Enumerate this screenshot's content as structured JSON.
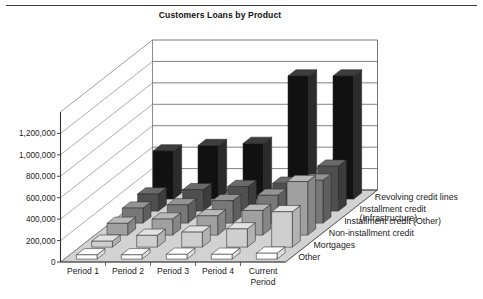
{
  "page": {
    "top_rule": true,
    "background": "#ffffff"
  },
  "chart_data": {
    "type": "bar",
    "variant": "3d-grouped-column",
    "title": "Customers Loans by Product",
    "xlabel": "",
    "ylabel": "",
    "categories": [
      "Period 1",
      "Period 2",
      "Period 3",
      "Period 4",
      "Current Period"
    ],
    "category_label_lines": [
      [
        "Period 1"
      ],
      [
        "Period 2"
      ],
      [
        "Period 3"
      ],
      [
        "Period 4"
      ],
      [
        "Current",
        "Period"
      ]
    ],
    "ylim": [
      0,
      1400000
    ],
    "yticks": [
      0,
      200000,
      400000,
      600000,
      800000,
      1000000,
      1200000
    ],
    "ytick_labels": [
      "0",
      "200,000",
      "400,000",
      "600,000",
      "800,000",
      "1,000,000",
      "1,200,000"
    ],
    "grid": true,
    "grid_axis": "y",
    "legend_position": "right-depth-axis",
    "series": [
      {
        "name": "Revolving credit lines",
        "label_lines": [
          "Revolving credit lines"
        ],
        "color": "#111111",
        "side_color": "#2b2b2b",
        "top_color": "#3d3d3d",
        "values": [
          450000,
          500000,
          520000,
          1150000,
          1150000
        ]
      },
      {
        "name": "Installment credit (Infrastructure)",
        "label_lines": [
          "Installment credit",
          "(Infrastructure)"
        ],
        "color": "#4f4f4f",
        "side_color": "#3c3c3c",
        "top_color": "#6a6a6a",
        "values": [
          160000,
          200000,
          230000,
          260000,
          420000
        ]
      },
      {
        "name": "Installment credit (Other)",
        "label_lines": [
          "Installment credit (Other)"
        ],
        "color": "#787878",
        "side_color": "#5f5f5f",
        "top_color": "#949494",
        "values": [
          140000,
          170000,
          210000,
          260000,
          400000
        ]
      },
      {
        "name": "Non-installment credit",
        "label_lines": [
          "Non-installment credit"
        ],
        "color": "#a0a0a0",
        "side_color": "#868686",
        "top_color": "#b8b8b8",
        "values": [
          110000,
          150000,
          180000,
          230000,
          500000
        ]
      },
      {
        "name": "Mortgages",
        "label_lines": [
          "Mortgages"
        ],
        "color": "#cfcfcf",
        "side_color": "#b2b2b2",
        "top_color": "#e2e2e2",
        "values": [
          55000,
          110000,
          140000,
          170000,
          330000
        ]
      },
      {
        "name": "Other",
        "label_lines": [
          "Other"
        ],
        "color": "#ffffff",
        "side_color": "#e0e0e0",
        "top_color": "#ffffff",
        "values": [
          40000,
          40000,
          45000,
          45000,
          55000
        ]
      }
    ]
  }
}
